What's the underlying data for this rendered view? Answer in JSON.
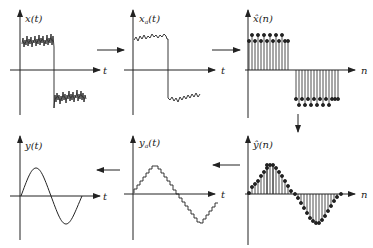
{
  "diagram": {
    "title": "",
    "panels": [
      {
        "id": "x_t",
        "label_main": "x",
        "label_sub": "",
        "label_arg": "(t)",
        "axis": "t",
        "kind": "noisy-analog"
      },
      {
        "id": "xa_t",
        "label_main": "x",
        "label_sub": "a",
        "label_arg": "(t)",
        "axis": "t",
        "kind": "filtered-analog"
      },
      {
        "id": "xhat_n",
        "label_main": "x̂",
        "label_sub": "",
        "label_arg": "(n)",
        "axis": "n",
        "kind": "sampled-discrete"
      },
      {
        "id": "yhat_n",
        "label_main": "ŷ",
        "label_sub": "",
        "label_arg": "(n)",
        "axis": "n",
        "kind": "processed-discrete"
      },
      {
        "id": "ya_t",
        "label_main": "y",
        "label_sub": "a",
        "label_arg": "(t)",
        "axis": "t",
        "kind": "staircase-analog"
      },
      {
        "id": "y_t",
        "label_main": "y",
        "label_sub": "",
        "label_arg": "(t)",
        "axis": "t",
        "kind": "smooth-analog"
      }
    ],
    "flow": [
      "x_t",
      "xa_t",
      "xhat_n",
      "yhat_n",
      "ya_t",
      "y_t"
    ],
    "colors": {
      "ink": "#222222",
      "background": "#ffffff"
    }
  }
}
